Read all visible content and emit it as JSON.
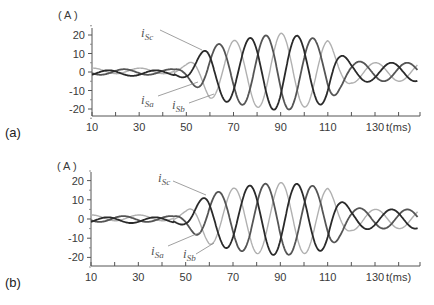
{
  "chart_data": [
    {
      "panel": "(a)",
      "type": "line",
      "title": "",
      "xlabel": "t(ms)",
      "ylabel": "(A)",
      "xlim": [
        10,
        149
      ],
      "ylim": [
        -25,
        27
      ],
      "grid": false,
      "x_ticks": [
        10,
        30,
        50,
        70,
        90,
        110,
        130
      ],
      "y_ticks": [
        20,
        10,
        0,
        -10,
        -20
      ],
      "frequency_hz": 50,
      "series": [
        {
          "name": "iSa",
          "color": "#2a2a2a",
          "phase_deg": 0
        },
        {
          "name": "iSb",
          "color": "#555555",
          "phase_deg": -120
        },
        {
          "name": "iSc",
          "color": "#b0b0b0",
          "phase_deg": 120
        }
      ],
      "envelope": {
        "t": [
          10,
          45,
          50,
          55,
          60,
          70,
          80,
          90,
          100,
          110,
          115,
          120,
          130,
          145
        ],
        "amplitude": [
          1.5,
          1.5,
          4,
          9,
          14,
          17,
          19,
          21,
          19,
          17,
          10,
          6,
          5,
          5
        ]
      },
      "annotations": [
        {
          "text": "iSc",
          "x": 56,
          "y": 19
        },
        {
          "text": "iSa",
          "x": 38,
          "y": -13
        },
        {
          "text": "iSb",
          "x": 50,
          "y": -16
        }
      ]
    },
    {
      "panel": "(b)",
      "type": "line",
      "title": "",
      "xlabel": "t(ms)",
      "ylabel": "(A)",
      "xlim": [
        10,
        149
      ],
      "ylim": [
        -25,
        27
      ],
      "grid": false,
      "x_ticks": [
        10,
        30,
        50,
        70,
        90,
        110,
        130
      ],
      "y_ticks": [
        20,
        10,
        0,
        -10,
        -20
      ],
      "frequency_hz": 50,
      "series": [
        {
          "name": "iSa",
          "color": "#2a2a2a",
          "phase_deg": 0
        },
        {
          "name": "iSb",
          "color": "#555555",
          "phase_deg": -120
        },
        {
          "name": "iSc",
          "color": "#b0b0b0",
          "phase_deg": 120
        }
      ],
      "envelope": {
        "t": [
          10,
          45,
          50,
          55,
          60,
          70,
          80,
          90,
          100,
          110,
          115,
          120,
          130,
          145
        ],
        "amplitude": [
          1.5,
          1.5,
          4,
          9,
          13,
          16,
          18,
          19,
          18,
          16,
          10,
          6,
          5,
          5
        ]
      },
      "annotations": [
        {
          "text": "iSc",
          "x": 56,
          "y": 18
        },
        {
          "text": "iSa",
          "x": 38,
          "y": -14
        },
        {
          "text": "iSb",
          "x": 50,
          "y": -16
        }
      ]
    }
  ],
  "panels": [
    {
      "label": "(a)",
      "unit": "( A )",
      "x_axis_title": "t(ms)",
      "x_tick_labels": [
        "10",
        "30",
        "50",
        "70",
        "90",
        "110",
        "130"
      ],
      "y_tick_labels": [
        "20",
        "10",
        "0",
        "-10",
        "-20"
      ],
      "curve_labels": {
        "a_main": "i",
        "a_sub": "Sa",
        "b_main": "i",
        "b_sub": "Sb",
        "c_main": "i",
        "c_sub": "Sc"
      }
    },
    {
      "label": "(b)",
      "unit": "( A )",
      "x_axis_title": "t(ms)",
      "x_tick_labels": [
        "10",
        "30",
        "50",
        "70",
        "90",
        "110",
        "130"
      ],
      "y_tick_labels": [
        "20",
        "10",
        "0",
        "-10",
        "-20"
      ],
      "curve_labels": {
        "a_main": "i",
        "a_sub": "Sa",
        "b_main": "i",
        "b_sub": "Sb",
        "c_main": "i",
        "c_sub": "Sc"
      }
    }
  ]
}
